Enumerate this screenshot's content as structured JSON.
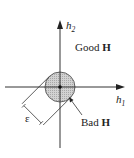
{
  "diagram": {
    "axes": {
      "h1_label": "h",
      "h1_sub": "1",
      "h2_label": "h",
      "h2_sub": "2"
    },
    "regions": {
      "good_label": "Good ",
      "good_bold": "H",
      "bad_label": "Bad ",
      "bad_bold": "H"
    },
    "radius_label": "ε",
    "colors": {
      "circle_fill": "#c8c8c8",
      "stroke": "#333333",
      "text": "#222222"
    }
  }
}
